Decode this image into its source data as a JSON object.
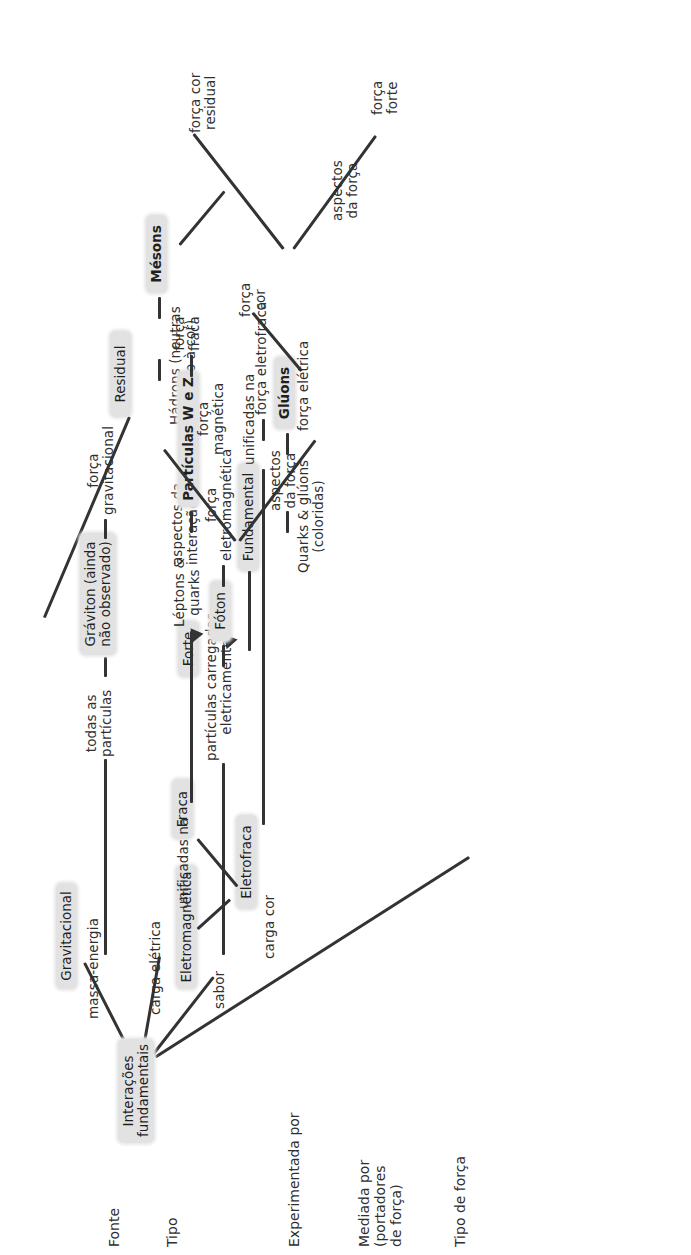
{
  "diagram": {
    "title": "Interações fundamentais",
    "language": "pt-BR",
    "node_fill": "#e2e2e2",
    "line_color": "#333333",
    "rotation": "-90deg"
  },
  "row_labels": [
    {
      "id": "fonte",
      "text": "Fonte"
    },
    {
      "id": "tipo",
      "text": "Tipo"
    },
    {
      "id": "experimentada",
      "text": "Experimentada por"
    },
    {
      "id": "mediada",
      "text": "Mediada por\n(portadores\nde força)"
    },
    {
      "id": "tipo_de_forca",
      "text": "Tipo de força"
    }
  ],
  "nodes": {
    "root": "Interações\nfundamentais",
    "gravitacional": "Gravitacional",
    "eletromagnetica": "Eletromagnética",
    "eletrofraca": "Eletrofraca",
    "fraca": "Fraca",
    "forte": "Forte",
    "fundamental": "Fundamental",
    "residual": "Residual",
    "graviton": "Gráviton (ainda\nnão observado)",
    "foton": "Fóton",
    "particulas_wz": "Partículas W e Z",
    "gluons": "Glúons",
    "mesons": "Mésons"
  },
  "edge_labels": {
    "massa_energia": "massa-energia",
    "carga_eletrica": "carga elétrica",
    "sabor": "sabor",
    "carga_cor": "carga cor",
    "unificadas_na_tipo": "unificadas na",
    "aspectos_da_interacao": "aspectos da\ninteração",
    "unificadas_na_forca": "unificadas na",
    "aspectos_da_forca_em": "aspectos\nda força",
    "aspectos_da_forca_forte": "aspectos\nda força"
  },
  "experienced_by": {
    "todas_particulas": "todas as\npartículas",
    "particulas_carregadas": "partículas carregadas\neletricamente",
    "leptons_quarks": "Léptons &\nquarks",
    "quarks_gluons": "Quarks & glúons\n(coloridas)",
    "hadrons": "Hádrons (neutras\nquanto à cor)"
  },
  "force_types": {
    "forca_gravitacional": "força\ngravitacional",
    "forca_eletromagnetica": "força\neletromagnética",
    "forca_fraca": "força\nfraca",
    "forca_eletrofraca": "força eletrofraca",
    "forca_cor": "força\ncor",
    "forca_eletrica": "força elétrica",
    "forca_magnetica": "força\nmagnética",
    "forca_forte": "força\nforte",
    "forca_cor_residual": "força cor\nresidual"
  }
}
